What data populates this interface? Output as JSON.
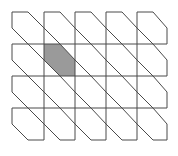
{
  "diagram": {
    "type": "hexagonal-cut-grid",
    "columns": 5,
    "rows": 4,
    "x_lines": [
      12,
      44,
      75,
      106,
      137,
      167
    ],
    "y_lines": [
      12,
      44,
      76,
      108,
      140
    ],
    "corner_cut": 16,
    "highlighted_cell": {
      "row": 1,
      "col": 1
    },
    "colors": {
      "stroke": "#4a4a4a",
      "highlight_fill": "#9a9a9a",
      "background": "#ffffff"
    }
  }
}
